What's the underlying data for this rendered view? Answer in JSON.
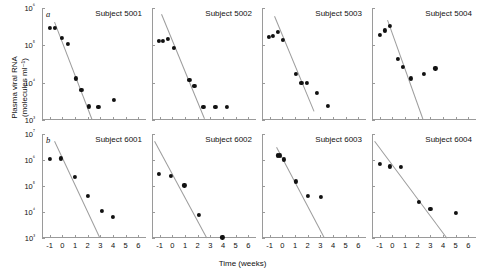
{
  "figure": {
    "ylabel_line1": "Plasma viral RNA",
    "ylabel_line2": "(molecules ml⁻¹)",
    "xlabel": "Time (weeks)",
    "marker_color": "#111111",
    "line_color": "#9c9c9c",
    "axis_color": "#9a9a9a"
  },
  "chart_data": {
    "type": "scatter",
    "title": "",
    "xlabel": "Time (weeks)",
    "ylabel": "Plasma viral RNA (molecules ml⁻¹)",
    "yscale": "log",
    "grid": false,
    "legend": "none",
    "xlim": [
      -1.6,
      6.6
    ],
    "xticks": [
      -1,
      0,
      1,
      2,
      3,
      4,
      5,
      6
    ],
    "xticklabels": [
      "-1",
      "0",
      "1",
      "2",
      "3",
      "4",
      "5",
      "6"
    ],
    "rows": [
      {
        "panel_label": "a",
        "ylim": [
          1000,
          1000000
        ],
        "yticks": [
          1000,
          10000,
          100000,
          1000000
        ],
        "yticklabels": [
          "10³",
          "10⁴",
          "10⁵",
          "10⁶"
        ],
        "panels": [
          {
            "title": "Subject 5001",
            "points": [
              {
                "x": -1.0,
                "y": 300000
              },
              {
                "x": -0.6,
                "y": 300000
              },
              {
                "x": 0.0,
                "y": 160000
              },
              {
                "x": 0.45,
                "y": 110000
              },
              {
                "x": 1.1,
                "y": 13000
              },
              {
                "x": 1.5,
                "y": 6500
              },
              {
                "x": 2.1,
                "y": 2300
              },
              {
                "x": 2.85,
                "y": 2200
              },
              {
                "x": 4.1,
                "y": 3500
              }
            ],
            "fit": {
              "x1": -0.55,
              "y1": 420000,
              "x2": 2.4,
              "y2": 1050
            }
          },
          {
            "title": "Subject 5002",
            "points": [
              {
                "x": -1.05,
                "y": 130000
              },
              {
                "x": -0.75,
                "y": 130000
              },
              {
                "x": -0.35,
                "y": 150000
              },
              {
                "x": 0.15,
                "y": 85000
              },
              {
                "x": 1.35,
                "y": 12000
              },
              {
                "x": 1.75,
                "y": 8000
              },
              {
                "x": 2.45,
                "y": 2200
              },
              {
                "x": 3.4,
                "y": 2200
              },
              {
                "x": 4.3,
                "y": 2200
              }
            ],
            "fit": {
              "x1": -0.85,
              "y1": 680000,
              "x2": 2.55,
              "y2": 1050
            }
          },
          {
            "title": "Subject 5003",
            "points": [
              {
                "x": -1.05,
                "y": 170000
              },
              {
                "x": -0.75,
                "y": 175000
              },
              {
                "x": -0.35,
                "y": 230000
              },
              {
                "x": 0.05,
                "y": 140000
              },
              {
                "x": 1.05,
                "y": 17000
              },
              {
                "x": 1.5,
                "y": 10000
              },
              {
                "x": 1.95,
                "y": 10000
              },
              {
                "x": 2.75,
                "y": 5200
              },
              {
                "x": 3.6,
                "y": 2400
              }
            ],
            "fit": {
              "x1": -0.6,
              "y1": 620000,
              "x2": 2.5,
              "y2": 1800
            }
          },
          {
            "title": "Subject 5004",
            "points": [
              {
                "x": -1.0,
                "y": 190000
              },
              {
                "x": -0.6,
                "y": 250000
              },
              {
                "x": -0.2,
                "y": 330000
              },
              {
                "x": 0.45,
                "y": 43000
              },
              {
                "x": 0.85,
                "y": 26000
              },
              {
                "x": 1.45,
                "y": 13000
              },
              {
                "x": 2.5,
                "y": 17000
              },
              {
                "x": 3.4,
                "y": 24000
              }
            ],
            "fit": {
              "x1": -0.35,
              "y1": 480000,
              "x2": 2.45,
              "y2": 1050
            }
          }
        ]
      },
      {
        "panel_label": "b",
        "ylim": [
          1000,
          10000000
        ],
        "yticks": [
          1000,
          10000,
          100000,
          1000000,
          10000000
        ],
        "yticklabels": [
          "10³",
          "10⁴",
          "10⁵",
          "10⁶",
          "10⁷"
        ],
        "panels": [
          {
            "title": "Subject 6001",
            "points": [
              {
                "x": -1.0,
                "y": 1100000
              },
              {
                "x": -0.1,
                "y": 1150000
              },
              {
                "x": 1.0,
                "y": 230000
              },
              {
                "x": 2.0,
                "y": 42000
              },
              {
                "x": 3.1,
                "y": 11000
              },
              {
                "x": 4.0,
                "y": 6500
              }
            ],
            "fit": {
              "x1": -0.55,
              "y1": 5200000,
              "x2": 3.0,
              "y2": 1050
            }
          },
          {
            "title": "Subject 6002",
            "points": [
              {
                "x": -1.05,
                "y": 290000
              },
              {
                "x": -0.1,
                "y": 240000
              },
              {
                "x": 0.95,
                "y": 105000
              },
              {
                "x": 2.1,
                "y": 8000
              },
              {
                "x": 3.95,
                "y": 1050
              }
            ],
            "fit": {
              "x1": -1.35,
              "y1": 5400000,
              "x2": 2.75,
              "y2": 1050
            }
          },
          {
            "title": "Subject 6003",
            "points": [
              {
                "x": -0.35,
                "y": 1500000
              },
              {
                "x": -0.2,
                "y": 1500000
              },
              {
                "x": 0.1,
                "y": 1050000
              },
              {
                "x": 1.05,
                "y": 150000
              },
              {
                "x": 2.05,
                "y": 42000
              },
              {
                "x": 3.05,
                "y": 38000
              }
            ],
            "fit": {
              "x1": -0.4,
              "y1": 3100000,
              "x2": 3.35,
              "y2": 1050
            }
          },
          {
            "title": "Subject 6004",
            "points": [
              {
                "x": -1.0,
                "y": 720000
              },
              {
                "x": -0.2,
                "y": 570000
              },
              {
                "x": 0.7,
                "y": 530000
              },
              {
                "x": 2.1,
                "y": 25000
              },
              {
                "x": 3.0,
                "y": 13000
              },
              {
                "x": 5.0,
                "y": 9000
              }
            ],
            "fit": {
              "x1": -1.35,
              "y1": 5600000,
              "x2": 4.35,
              "y2": 1050
            }
          }
        ]
      }
    ]
  }
}
